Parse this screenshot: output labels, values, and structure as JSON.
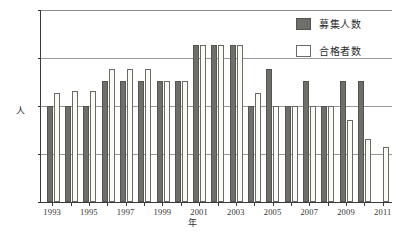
{
  "chart_data": {
    "type": "bar",
    "title": "",
    "xlabel": "年",
    "ylabel": "人",
    "ylim": [
      0,
      80
    ],
    "yticks": [
      0,
      20,
      40,
      60,
      80
    ],
    "grid": true,
    "legend_position": "top-right",
    "categories": [
      "1993",
      "1994",
      "1995",
      "1996",
      "1997",
      "1998",
      "1999",
      "2000",
      "2001",
      "2002",
      "2003",
      "2004",
      "2005",
      "2006",
      "2007",
      "2008",
      "2009",
      "2010",
      "2011"
    ],
    "tick_labels": [
      "1993",
      "1995",
      "1997",
      "1999",
      "2001",
      "2003",
      "2005",
      "2007",
      "2009",
      "2011"
    ],
    "series": [
      {
        "name": "募集人数",
        "color": "#6e6e6a",
        "values": [
          40,
          40,
          40,
          50,
          50,
          50,
          50,
          50,
          65,
          65,
          65,
          40,
          55,
          40,
          50,
          40,
          50,
          50,
          0
        ]
      },
      {
        "name": "合格者数",
        "color": "#fbfbf5",
        "values": [
          45,
          46,
          46,
          55,
          55,
          55,
          50,
          50,
          65,
          65,
          65,
          45,
          40,
          40,
          40,
          40,
          34,
          26,
          23
        ]
      }
    ]
  },
  "legend": {
    "items": [
      {
        "label": "募集人数",
        "swatch": "recruit"
      },
      {
        "label": "合格者数",
        "swatch": "pass"
      }
    ]
  },
  "axes": {
    "y_label": "人",
    "x_label": "年",
    "y_tick_0": "0",
    "y_tick_20": "20",
    "y_tick_40": "40",
    "y_tick_60": "60",
    "y_tick_80": "80"
  }
}
